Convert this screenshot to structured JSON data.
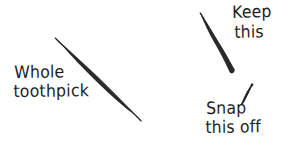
{
  "figure": {
    "background_color": "#ffffff",
    "ink_color": "#2a2a2a",
    "text_color": "#1e1e1e",
    "width": 287,
    "height": 153
  },
  "labels": {
    "whole_toothpick": {
      "line1": "Whole",
      "line2": "toothpick"
    },
    "keep": {
      "line1": "Keep",
      "line2": "this"
    },
    "snap": {
      "line1": "Snap",
      "line2": "this off"
    }
  },
  "drawings": {
    "whole_toothpick": {
      "name": "whole-toothpick-sliver",
      "description": "long tapered toothpick drawn diagonally from upper-left to lower-right, thickest at middle",
      "start": [
        55,
        38
      ],
      "end": [
        141,
        121
      ],
      "max_thickness_px": 3.4
    },
    "keep_piece": {
      "name": "keep-piece-sliver",
      "description": "upper toothpick fragment, sharp thin point at top, blunt snapped end at bottom",
      "start": [
        200,
        13
      ],
      "end": [
        234,
        73
      ],
      "max_thickness_px": 3.2
    },
    "snap_piece": {
      "name": "snap-off-piece-stub",
      "description": "short broken-off toothpick stub, thick at top-right tapering to lower-left",
      "start": [
        252,
        84
      ],
      "end": [
        241,
        104
      ],
      "max_thickness_px": 2.8
    }
  }
}
